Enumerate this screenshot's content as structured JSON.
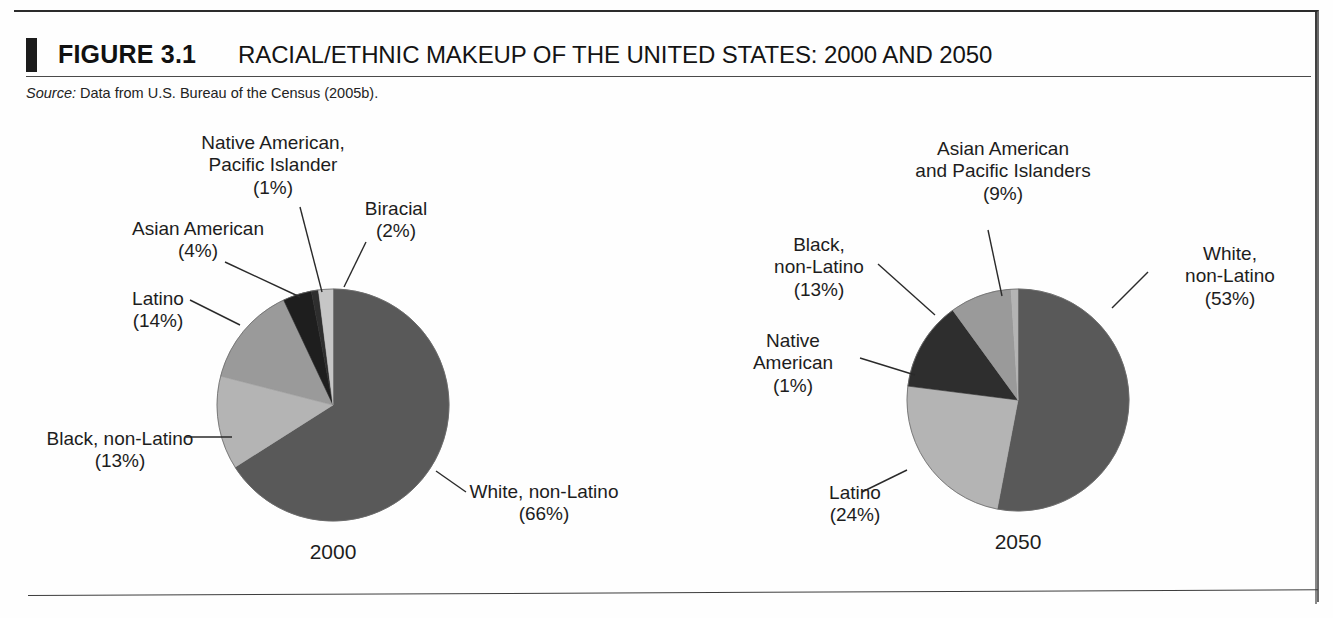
{
  "figure": {
    "number": "FIGURE 3.1",
    "title": "RACIAL/ETHNIC MAKEUP OF THE UNITED STATES: 2000 AND 2050",
    "source_label": "Source:",
    "source_text": " Data from U.S. Bureau of the Census (2005b)."
  },
  "colors": {
    "white_non_latino": "#595959",
    "black_non_latino": "#b4b4b4",
    "latino": "#9a9a9a",
    "asian_american": "#1e1e1e",
    "native_american": "#2e2e2e",
    "biracial": "#c6c6c6",
    "asian_pacific": "#9a9a9a",
    "leader_line": "#2a2a2a",
    "pie_outline": "#6a6a6a"
  },
  "chart_data": [
    {
      "type": "pie",
      "title": "2000",
      "year_label": "2000",
      "legend_position": "callouts",
      "unit": "%",
      "categories": [
        "White, non-Latino",
        "Black, non-Latino",
        "Latino",
        "Asian American",
        "Native American, Pacific Islander",
        "Biracial"
      ],
      "values": [
        66,
        13,
        14,
        4,
        1,
        2
      ],
      "slices": [
        {
          "name": "White, non-Latino",
          "value": 66,
          "label_line1": "White, non-Latino",
          "label_line2": "(66%)",
          "color": "#595959"
        },
        {
          "name": "Black, non-Latino",
          "value": 13,
          "label_line1": "Black, non-Latino",
          "label_line2": "(13%)",
          "color": "#b4b4b4"
        },
        {
          "name": "Latino",
          "value": 14,
          "label_line1": "Latino",
          "label_line2": "(14%)",
          "color": "#9a9a9a"
        },
        {
          "name": "Asian American",
          "value": 4,
          "label_line1": "Asian American",
          "label_line2": "(4%)",
          "color": "#1e1e1e"
        },
        {
          "name": "Native American, Pacific Islander",
          "value": 1,
          "label_line1": "Native American,",
          "label_line2": "Pacific Islander",
          "label_line3": "(1%)",
          "color": "#2e2e2e"
        },
        {
          "name": "Biracial",
          "value": 2,
          "label_line1": "Biracial",
          "label_line2": "(2%)",
          "color": "#c6c6c6"
        }
      ]
    },
    {
      "type": "pie",
      "title": "2050",
      "year_label": "2050",
      "legend_position": "callouts",
      "unit": "%",
      "categories": [
        "White, non-Latino",
        "Latino",
        "Black, non-Latino",
        "Asian American and Pacific Islanders",
        "Native American"
      ],
      "values": [
        53,
        24,
        13,
        9,
        1
      ],
      "slices": [
        {
          "name": "White, non-Latino",
          "value": 53,
          "label_line1": "White,",
          "label_line2": "non-Latino",
          "label_line3": "(53%)",
          "color": "#595959"
        },
        {
          "name": "Latino",
          "value": 24,
          "label_line1": "Latino",
          "label_line2": "(24%)",
          "color": "#b4b4b4"
        },
        {
          "name": "Black, non-Latino",
          "value": 13,
          "label_line1": "Black,",
          "label_line2": "non-Latino",
          "label_line3": "(13%)",
          "color": "#2e2e2e"
        },
        {
          "name": "Asian American and Pacific Islanders",
          "value": 9,
          "label_line1": "Asian American",
          "label_line2": "and Pacific Islanders",
          "label_line3": "(9%)",
          "color": "#9a9a9a"
        },
        {
          "name": "Native American",
          "value": 1,
          "label_line1": "Native",
          "label_line2": "American",
          "label_line3": "(1%)",
          "color": "#b4b4b4"
        }
      ]
    }
  ],
  "callouts_2000": {
    "native_pacific": "Native American,\nPacific Islander\n(1%)",
    "biracial": "Biracial\n(2%)",
    "asian_american": "Asian American\n(4%)",
    "latino": "Latino\n(14%)",
    "black_non_latino": "Black, non-Latino\n(13%)",
    "white_non_latino": "White, non-Latino\n(66%)",
    "year": "2000"
  },
  "callouts_2050": {
    "asian_pacific": "Asian American\nand Pacific Islanders\n(9%)",
    "black_non_latino": "Black,\nnon-Latino\n(13%)",
    "native_american": "Native\nAmerican\n(1%)",
    "latino": "Latino\n(24%)",
    "white_non_latino": "White,\nnon-Latino\n(53%)",
    "year": "2050"
  }
}
